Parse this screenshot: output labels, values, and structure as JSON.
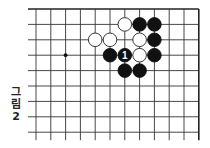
{
  "caption": {
    "chars": [
      "그",
      "림",
      "2"
    ],
    "text": "그림 2"
  },
  "board": {
    "view": "top-right corner region",
    "columns": 12,
    "rows": 9,
    "origin_x": 36,
    "origin_y": 9,
    "spacing_x": 14.8,
    "spacing_y": 15.4,
    "line_color": "#333333",
    "edge_color": "#222222",
    "star_points": [
      {
        "col": 2,
        "row": 3
      }
    ],
    "stones": [
      {
        "col": 6,
        "row": 1,
        "color": "white"
      },
      {
        "col": 7,
        "row": 1,
        "color": "black"
      },
      {
        "col": 8,
        "row": 1,
        "color": "black"
      },
      {
        "col": 4,
        "row": 2,
        "color": "white"
      },
      {
        "col": 5,
        "row": 2,
        "color": "white"
      },
      {
        "col": 7,
        "row": 2,
        "color": "white"
      },
      {
        "col": 8,
        "row": 2,
        "color": "black"
      },
      {
        "col": 5,
        "row": 3,
        "color": "black"
      },
      {
        "col": 6,
        "row": 3,
        "color": "black",
        "label": "1"
      },
      {
        "col": 7,
        "row": 3,
        "color": "white"
      },
      {
        "col": 8,
        "row": 3,
        "color": "black"
      },
      {
        "col": 6,
        "row": 4,
        "color": "black"
      },
      {
        "col": 7,
        "row": 4,
        "color": "black"
      }
    ]
  }
}
